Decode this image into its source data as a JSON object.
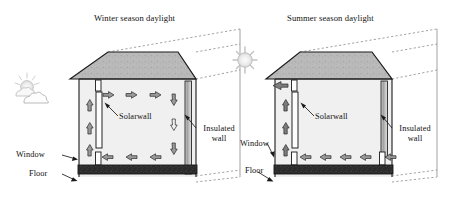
{
  "figure": {
    "kind": "architecture-section-diagram"
  },
  "panels": [
    {
      "id": "winter",
      "title": "Winter season daylight",
      "sky_icon": "sun-behind-cloud-icon",
      "labels": {
        "solarwall": "Solarwall",
        "insulated_wall": "Insulated\nwall",
        "insulated_wall_line1": "Insulated",
        "insulated_wall_line2": "wall",
        "window": "Window",
        "floor": "Floor"
      },
      "airflow": {
        "mode": "closed-loop recirculation",
        "up_arrows_at_solarwall": 3,
        "top_arrows_direction": "right",
        "top_arrows_count": 3,
        "right_arrows_direction": "down",
        "right_arrows_count": 3,
        "bottom_arrows_direction": "left",
        "bottom_arrows_count": 3,
        "exhaust_arrow": "none"
      }
    },
    {
      "id": "summer",
      "title": "Summer season daylight",
      "sky_icon": "bright-sun-icon",
      "labels": {
        "solarwall": "Solarwall",
        "insulated_wall": "Insulated\nwall",
        "insulated_wall_line1": "Insulated",
        "insulated_wall_line2": "wall",
        "window": "Window",
        "floor": "Floor"
      },
      "airflow": {
        "mode": "open exhaust ventilation",
        "up_arrows_at_solarwall": 3,
        "top_arrows_direction": "left",
        "top_arrows_count": 0,
        "right_arrows_count": 0,
        "bottom_arrows_direction": "left",
        "bottom_arrows_count": 5,
        "exhaust_arrow": "left at roof level"
      }
    }
  ],
  "colors": {
    "roof_fill": "#b9b9b9",
    "wall_fill": "#f2f2f2",
    "interior_fill": "#ededed",
    "arrow_fill": "#9a9a9a",
    "arrow_fill_light": "#f0f0f0",
    "floor_fill": "#2b2b2b",
    "outline": "#1a1a1a",
    "dotted": "#7a7a7a",
    "sun_fill": "#f0f0f0",
    "cloud_fill": "#f7f7f7"
  }
}
